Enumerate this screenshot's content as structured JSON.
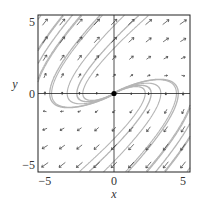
{
  "chart_data": {
    "type": "phase-portrait",
    "title": "",
    "xlabel": "x",
    "ylabel": "y",
    "xlim": [
      -5.5,
      5.5
    ],
    "ylim": [
      -5.5,
      5.5
    ],
    "xticks": [
      -5,
      0,
      5
    ],
    "yticks": [
      -5,
      0,
      5
    ],
    "xtick_labels": [
      "−5",
      "0",
      "5"
    ],
    "ytick_labels": [
      "−5",
      "0",
      "5"
    ],
    "system": {
      "dx": "y",
      "dy": "-0.3*x + y"
    },
    "equilibrium": {
      "x": 0,
      "y": 0,
      "label": "source (unstable spiral)"
    },
    "trajectory_seeds": [
      [
        -5.5,
        1.0
      ],
      [
        -5.5,
        3.0
      ],
      [
        -5.5,
        5.2
      ],
      [
        -3.0,
        5.5
      ],
      [
        -1.0,
        5.5
      ],
      [
        5.5,
        -1.0
      ],
      [
        5.5,
        -3.0
      ],
      [
        5.5,
        -5.2
      ],
      [
        3.0,
        -5.5
      ],
      [
        1.0,
        -5.5
      ],
      [
        -2.0,
        1.5
      ],
      [
        2.0,
        -1.5
      ]
    ],
    "grid": false,
    "colors": {
      "trajectory": "#b5b5b5",
      "arrow": "#333333",
      "axis": "#222222",
      "dot": "#000000"
    }
  }
}
